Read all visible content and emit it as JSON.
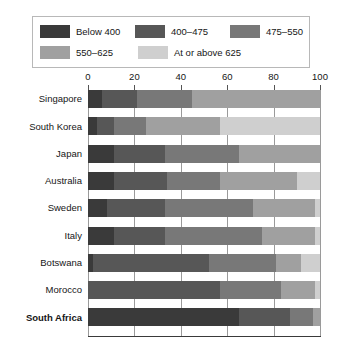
{
  "legend": {
    "rows": [
      [
        {
          "label": "Below 400",
          "color": "#3a3a3a",
          "swatch_name": "legend-swatch-below-400"
        },
        {
          "label": "400–475",
          "color": "#575757",
          "swatch_name": "legend-swatch-400-475"
        },
        {
          "label": "475–550",
          "color": "#787878",
          "swatch_name": "legend-swatch-475-550"
        }
      ],
      [
        {
          "label": "550–625",
          "color": "#a0a0a0",
          "swatch_name": "legend-swatch-550-625"
        },
        {
          "label": "At or above 625",
          "color": "#cfcfcf",
          "swatch_name": "legend-swatch-at-or-above-625"
        }
      ]
    ]
  },
  "chart_data": {
    "type": "bar",
    "orientation": "horizontal",
    "stacked": true,
    "title": "",
    "xlabel": "",
    "ylabel": "",
    "xlim": [
      0,
      100
    ],
    "ticks": [
      0,
      20,
      40,
      60,
      80,
      100
    ],
    "tick_labels": [
      "0",
      "20",
      "40",
      "60",
      "80",
      "100"
    ],
    "grid": true,
    "legend_position": "top",
    "categories": [
      "Singapore",
      "South Korea",
      "Japan",
      "Australia",
      "Sweden",
      "Italy",
      "Botswana",
      "Morocco",
      "South Africa"
    ],
    "bold_categories": [
      "South Africa"
    ],
    "series": [
      {
        "name": "Below 400",
        "color": "#3a3a3a",
        "values": [
          6,
          4,
          11,
          11,
          8,
          11,
          2,
          0,
          65
        ]
      },
      {
        "name": "400–475",
        "color": "#575757",
        "values": [
          15,
          7,
          22,
          23,
          25,
          22,
          50,
          57,
          22
        ]
      },
      {
        "name": "475–550",
        "color": "#787878",
        "values": [
          24,
          14,
          32,
          23,
          38,
          42,
          29,
          26,
          10
        ]
      },
      {
        "name": "550–625",
        "color": "#a0a0a0",
        "values": [
          55,
          32,
          35,
          33,
          27,
          23,
          11,
          15,
          3
        ]
      },
      {
        "name": "At or above 625",
        "color": "#cfcfcf",
        "values": [
          0,
          43,
          0,
          10,
          2,
          2,
          8,
          2,
          0
        ]
      }
    ]
  }
}
